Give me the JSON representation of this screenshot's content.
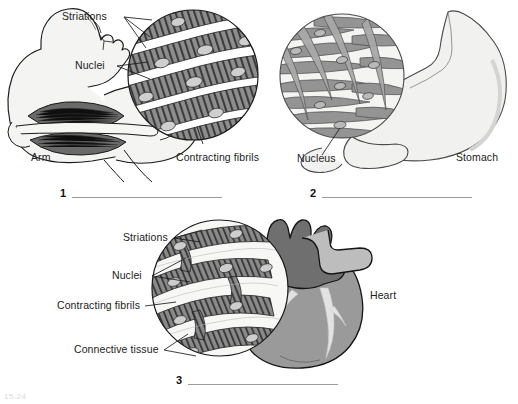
{
  "figure": {
    "background": "#ffffff",
    "ink": "#1a1a1a"
  },
  "panels": [
    {
      "number": "1",
      "tissue": "skeletal muscle",
      "organ_label": "Arm",
      "micrograph_labels": [
        "Striations",
        "Nuclei",
        "Contracting fibrils"
      ],
      "answer_line": true
    },
    {
      "number": "2",
      "tissue": "smooth muscle",
      "organ_label": "Stomach",
      "micrograph_labels": [
        "Nucleus"
      ],
      "answer_line": true
    },
    {
      "number": "3",
      "tissue": "cardiac muscle",
      "organ_label": "Heart",
      "micrograph_labels": [
        "Striations",
        "Nuclei",
        "Contracting fibrils",
        "Connective tissue"
      ],
      "answer_line": true
    }
  ],
  "labels": {
    "p1_striations": "Striations",
    "p1_nuclei": "Nuclei",
    "p1_fibrils": "Contracting fibrils",
    "p1_arm": "Arm",
    "p1_num": "1",
    "p2_nucleus": "Nucleus",
    "p2_stomach": "Stomach",
    "p2_num": "2",
    "p3_striations": "Striations",
    "p3_nuclei": "Nuclei",
    "p3_fibrils": "Contracting fibrils",
    "p3_connective": "Connective tissue",
    "p3_heart": "Heart",
    "p3_num": "3"
  },
  "footer": {
    "text": "15-24"
  },
  "colors": {
    "outline": "#1a1a1a",
    "skin_fill": "#f4f4f2",
    "muscle_dark": "#5e5e5e",
    "muscle_mid": "#8d8d8d",
    "muscle_light": "#c9c9c9",
    "tissue_pale": "#f0f0ee",
    "heart_atria": "#6f6f6f",
    "heart_ventricle": "#9a9a9a",
    "heart_vessel": "#dcdcdc",
    "stomach_fill": "#f1f1ef",
    "answer_rule": "#9b9b9b"
  }
}
